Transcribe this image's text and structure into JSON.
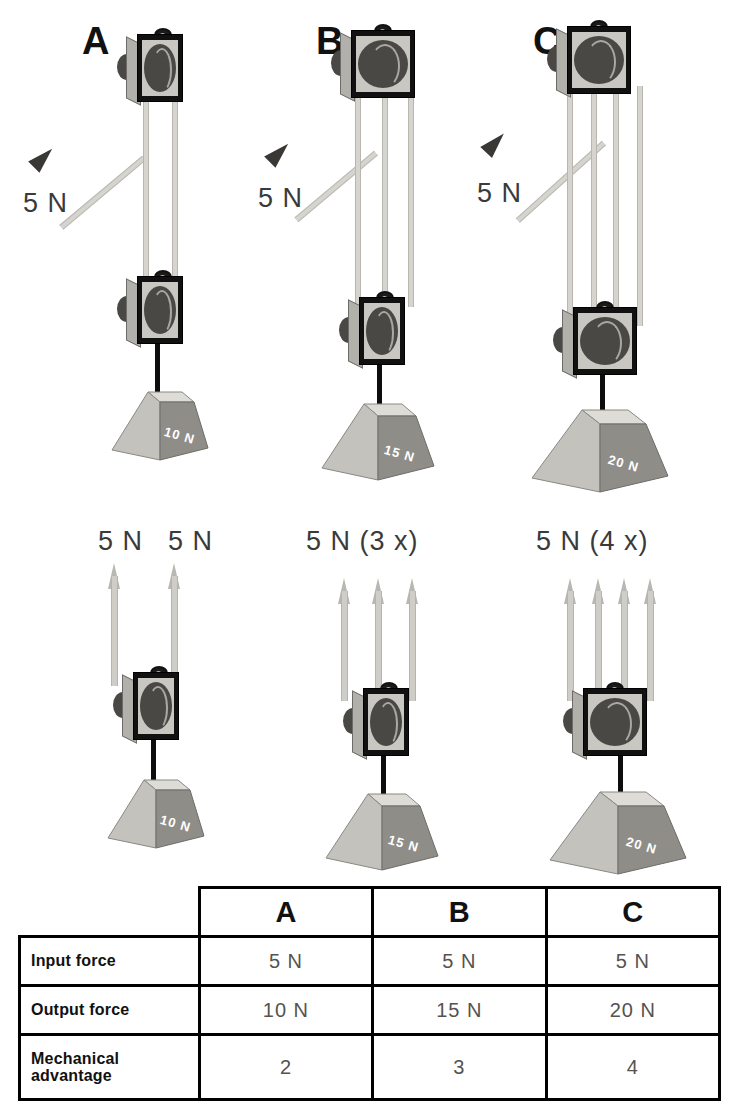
{
  "diagram": {
    "colors": {
      "background": "#ffffff",
      "rope": "#d6d4cf",
      "arrow_gray": "#b9b7b2",
      "arrow_dark": "#3a3835",
      "block_frame": "#c9c7c2",
      "block_dark": "#111111",
      "weight_light": "#c4c2bd",
      "weight_dark": "#8f8d88",
      "table_border": "#000000",
      "value_text": "#55534f"
    },
    "systems": [
      {
        "letter": "A",
        "input_label": "5 N",
        "weight_label": "10 N",
        "support_label": "5 N  5 N",
        "support_labels": [
          "5 N",
          "5 N"
        ],
        "rope_segments": 2,
        "sheaves": 1,
        "mechanical_advantage": "2"
      },
      {
        "letter": "B",
        "input_label": "5 N",
        "weight_label": "15 N",
        "support_label": "5 N (3 x)",
        "support_labels": [
          "5 N (3 x)"
        ],
        "rope_segments": 3,
        "sheaves": 2,
        "mechanical_advantage": "3"
      },
      {
        "letter": "C",
        "input_label": "5 N",
        "weight_label": "20 N",
        "support_label": "5 N (4 x)",
        "support_labels": [
          "5 N (4 x)"
        ],
        "rope_segments": 4,
        "sheaves": 2,
        "mechanical_advantage": "4"
      }
    ]
  },
  "table": {
    "corner_label": "",
    "column_headers": [
      "A",
      "B",
      "C"
    ],
    "rows": [
      {
        "label": "Input force",
        "values": [
          "5 N",
          "5 N",
          "5 N"
        ]
      },
      {
        "label": "Output force",
        "values": [
          "10 N",
          "15 N",
          "20 N"
        ]
      },
      {
        "label": "Mechanical advantage",
        "values": [
          "2",
          "3",
          "4"
        ]
      }
    ]
  }
}
